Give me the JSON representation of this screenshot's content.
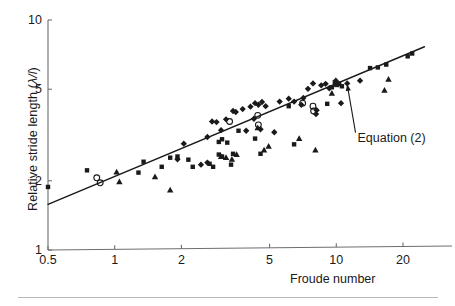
{
  "figure": {
    "background_color": "#ffffff",
    "ink_color": "#1a1a1a",
    "axis_color": "#6e6e6e",
    "rule_color": "#b9b9b9"
  },
  "axes": {
    "x_label": "Froude number",
    "y_label_prefix": "Relative stride length (",
    "y_label_lambda": "λ/l",
    "y_label_suffix": ")",
    "y_label_full": "Relative stride length (λ/l)",
    "x_ticks": [
      "0.5",
      "1",
      "2",
      "5",
      "10",
      "20"
    ],
    "y_ticks": [
      "10",
      "5",
      "2",
      "1"
    ],
    "x_scale": "log",
    "y_scale": "log",
    "x_range": [
      0.5,
      25
    ],
    "y_range": [
      1,
      10
    ],
    "grid": "off"
  },
  "annotations": [
    {
      "id": "equation-2",
      "text": "Equation (2)"
    }
  ],
  "legend": {
    "position": "none",
    "entries": []
  },
  "chart_data": {
    "type": "scatter",
    "title": "",
    "subtitle": "",
    "xlabel": "Froude number",
    "ylabel": "Relative stride length (λ/l)",
    "xscale": "log",
    "yscale": "log",
    "xlim": [
      0.5,
      25
    ],
    "ylim": [
      1,
      10
    ],
    "xticks": [
      0.5,
      1,
      2,
      5,
      10,
      20
    ],
    "yticks": [
      1,
      2,
      5,
      10
    ],
    "grid": false,
    "legend_position": "none",
    "annotations": [
      {
        "text": "Equation (2)",
        "text_x": 13.0,
        "text_y": 3.05,
        "arrow_tip_x": 11.2,
        "arrow_tip_y": 5.25
      }
    ],
    "fit_line": {
      "name": "Equation (2)",
      "style": "solid",
      "color": "#1a1a1a",
      "width": 1.4,
      "x_start": 0.5,
      "y_start": 1.58,
      "x_end": 25.0,
      "y_end": 7.65,
      "slope_loglog": 0.39,
      "intercept_at_x1": 1.85
    },
    "series": [
      {
        "name": "filled-square",
        "marker": "square",
        "fill": "#1a1a1a",
        "points": [
          [
            0.5,
            1.88
          ],
          [
            0.75,
            2.22
          ],
          [
            1.28,
            2.17
          ],
          [
            1.35,
            2.42
          ],
          [
            1.63,
            2.3
          ],
          [
            2.15,
            2.47
          ],
          [
            2.25,
            2.3
          ],
          [
            2.68,
            2.37
          ],
          [
            2.78,
            2.3
          ],
          [
            1.78,
            2.52
          ],
          [
            1.92,
            2.55
          ],
          [
            2.95,
            2.95
          ],
          [
            3.05,
            3.03
          ],
          [
            3.22,
            2.93
          ],
          [
            3.42,
            2.62
          ],
          [
            3.05,
            2.55
          ],
          [
            3.35,
            2.35
          ],
          [
            2.95,
            2.6
          ],
          [
            4.55,
            2.62
          ],
          [
            6.45,
            2.88
          ],
          [
            3.62,
            3.3
          ],
          [
            4.3,
            3.05
          ],
          [
            9.1,
            4.32
          ],
          [
            9.55,
            5.1
          ],
          [
            9.85,
            5.35
          ],
          [
            10.0,
            5.22
          ],
          [
            10.3,
            5.3
          ],
          [
            14.2,
            6.18
          ],
          [
            15.4,
            6.22
          ],
          [
            16.8,
            6.4
          ],
          [
            21.0,
            6.95
          ],
          [
            22.0,
            7.15
          ],
          [
            10.6,
            5.15
          ],
          [
            6.1,
            4.22
          ]
        ]
      },
      {
        "name": "filled-diamond",
        "marker": "diamond",
        "fill": "#1a1a1a",
        "points": [
          [
            1.92,
            2.48
          ],
          [
            2.05,
            2.9
          ],
          [
            2.45,
            2.35
          ],
          [
            2.62,
            3.1
          ],
          [
            2.75,
            3.62
          ],
          [
            2.88,
            3.6
          ],
          [
            2.62,
            2.4
          ],
          [
            3.02,
            3.32
          ],
          [
            3.18,
            3.7
          ],
          [
            3.42,
            4.02
          ],
          [
            3.52,
            3.98
          ],
          [
            3.78,
            4.1
          ],
          [
            4.1,
            4.2
          ],
          [
            4.3,
            4.35
          ],
          [
            4.45,
            4.28
          ],
          [
            4.55,
            3.35
          ],
          [
            4.62,
            4.4
          ],
          [
            4.8,
            4.22
          ],
          [
            5.25,
            3.25
          ],
          [
            5.55,
            4.42
          ],
          [
            6.1,
            4.55
          ],
          [
            6.45,
            4.42
          ],
          [
            6.95,
            4.28
          ],
          [
            7.1,
            4.58
          ],
          [
            7.45,
            5.02
          ],
          [
            7.85,
            5.3
          ],
          [
            8.1,
            3.9
          ],
          [
            8.15,
            4.05
          ],
          [
            8.55,
            5.2
          ],
          [
            8.95,
            5.28
          ],
          [
            9.3,
            5.05
          ],
          [
            9.95,
            5.45
          ],
          [
            10.2,
            5.25
          ],
          [
            10.5,
            4.35
          ],
          [
            11.2,
            5.3
          ],
          [
            12.8,
            5.45
          ],
          [
            3.92,
            3.3
          ],
          [
            4.25,
            3.72
          ]
        ]
      },
      {
        "name": "filled-triangle",
        "marker": "triangle",
        "fill": "#1a1a1a",
        "points": [
          [
            1.02,
            2.18
          ],
          [
            1.05,
            1.98
          ],
          [
            1.52,
            2.08
          ],
          [
            1.78,
            1.82
          ],
          [
            3.02,
            2.55
          ],
          [
            3.18,
            2.52
          ],
          [
            3.38,
            2.48
          ],
          [
            4.42,
            3.4
          ],
          [
            4.72,
            2.72
          ],
          [
            4.95,
            2.82
          ],
          [
            6.8,
            3.05
          ],
          [
            8.05,
            2.72
          ],
          [
            9.55,
            4.8
          ],
          [
            16.5,
            4.95
          ],
          [
            17.2,
            5.52
          ],
          [
            3.55,
            2.6
          ]
        ]
      },
      {
        "name": "open-circle",
        "marker": "circle-open",
        "fill": "none",
        "stroke": "#1a1a1a",
        "points": [
          [
            0.83,
            2.06
          ],
          [
            0.86,
            1.96
          ],
          [
            3.3,
            3.62
          ],
          [
            4.42,
            3.85
          ],
          [
            4.45,
            3.5
          ],
          [
            7.05,
            4.35
          ],
          [
            7.85,
            4.22
          ],
          [
            7.9,
            4.02
          ]
        ]
      }
    ]
  }
}
